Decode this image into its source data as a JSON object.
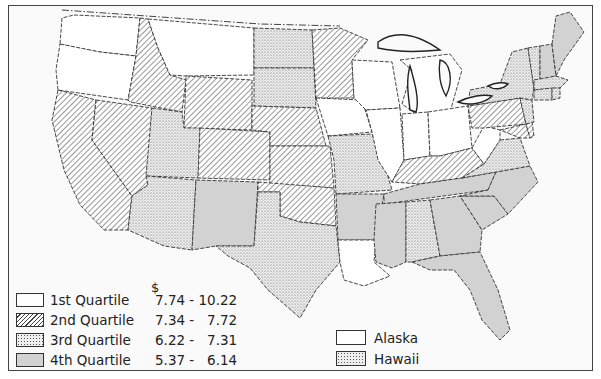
{
  "map": {
    "currency_symbol": "$",
    "legend": [
      {
        "key": "q1",
        "label": "1st Quartile",
        "range": "7.74 - 10.22",
        "pattern": "blank",
        "color": "#ffffff"
      },
      {
        "key": "q2",
        "label": "2nd Quartile",
        "range": "7.34 -   7.72",
        "pattern": "hatched",
        "color": "#444444"
      },
      {
        "key": "q3",
        "label": "3rd Quartile",
        "range": "6.22 -   7.31",
        "pattern": "dotted",
        "color": "#777777"
      },
      {
        "key": "q4",
        "label": "4th Quartile",
        "range": "5.37 -   6.14",
        "pattern": "gray",
        "color": "#d2d2d2"
      }
    ],
    "inset_legend": [
      {
        "label": "Alaska",
        "quartile": "q1"
      },
      {
        "label": "Hawaii",
        "quartile": "q3"
      }
    ],
    "states": {
      "WA": "q1",
      "OR": "q1",
      "ID": "q2",
      "MT": "q1",
      "WY": "q2",
      "CA": "q2",
      "NV": "q2",
      "UT": "q3",
      "CO": "q2",
      "AZ": "q3",
      "NM": "q4",
      "ND": "q3",
      "SD": "q3",
      "NE": "q2",
      "KS": "q2",
      "OK": "q2",
      "TX": "q3",
      "MN": "q2",
      "IA": "q1",
      "MO": "q3",
      "AR": "q4",
      "LA": "q1",
      "WI": "q1",
      "IL": "q1",
      "MI": "q1",
      "IN": "q1",
      "OH": "q1",
      "KY": "q2",
      "TN": "q4",
      "MS": "q4",
      "AL": "q3",
      "GA": "q4",
      "FL": "q4",
      "SC": "q4",
      "NC": "q4",
      "VA": "q3",
      "WV": "q1",
      "PA": "q2",
      "NY": "q3",
      "VT": "q3",
      "NH": "q4",
      "ME": "q4",
      "MA": "q3",
      "CT": "q3",
      "RI": "q3",
      "NJ": "q3",
      "DE": "q2",
      "MD": "q2"
    }
  }
}
